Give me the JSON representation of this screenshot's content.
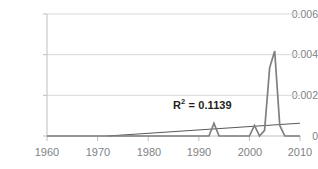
{
  "chart_data": {
    "type": "line",
    "title": "",
    "xlabel": "",
    "ylabel": "",
    "xlim": [
      1960,
      2010
    ],
    "ylim": [
      0,
      0.006
    ],
    "grid": true,
    "legend": false,
    "annotations": [
      {
        "name": "r2-label",
        "text_prefix": "R",
        "text_sup": "2",
        "text_suffix": " = 0.1139",
        "value": 0.1139
      }
    ],
    "yticks": [
      "0",
      "0.002",
      "0.004",
      "0.006"
    ],
    "ytick_values": [
      0,
      0.002,
      0.004,
      0.006
    ],
    "xticks": [
      "1960",
      "1970",
      "1980",
      "1990",
      "2000",
      "2010"
    ],
    "xtick_values": [
      1960,
      1970,
      1980,
      1990,
      2000,
      2010
    ],
    "series": [
      {
        "name": "data",
        "color": "#7f7f7f",
        "x": [
          1960,
          1961,
          1962,
          1963,
          1964,
          1965,
          1966,
          1967,
          1968,
          1969,
          1970,
          1971,
          1972,
          1973,
          1974,
          1975,
          1976,
          1977,
          1978,
          1979,
          1980,
          1981,
          1982,
          1983,
          1984,
          1985,
          1986,
          1987,
          1988,
          1989,
          1990,
          1991,
          1992,
          1993,
          1994,
          1995,
          1996,
          1997,
          1998,
          1999,
          2000,
          2001,
          2002,
          2003,
          2004,
          2005,
          2006,
          2007,
          2008,
          2009,
          2010
        ],
        "values": [
          0,
          0,
          0,
          0,
          0,
          0,
          0,
          0,
          0,
          0,
          0,
          0,
          0,
          0,
          0,
          0,
          0,
          0,
          0,
          0,
          0,
          0,
          0,
          0,
          0,
          0,
          0,
          0,
          0,
          0,
          0,
          0,
          0,
          0.00062,
          0,
          0,
          0,
          0,
          0,
          0,
          0,
          0.00052,
          0,
          0.00028,
          0.00335,
          0.00418,
          0.00052,
          0,
          0,
          0,
          0
        ]
      },
      {
        "name": "linear-trendline",
        "color": "#58595b",
        "x": [
          1972,
          2010
        ],
        "values": [
          0,
          0.00063
        ]
      }
    ]
  },
  "axis": {
    "y_tick_labels": [
      "0.006",
      "0.004",
      "0.002",
      "0"
    ],
    "x_tick_labels": [
      "1960",
      "1970",
      "1980",
      "1990",
      "2000",
      "2010"
    ]
  },
  "colors": {
    "series": "#7f7f7f",
    "trendline": "#58595b",
    "gridline": "#d9d9d9",
    "axis_text": "#808285",
    "annotation_text": "#231f20"
  }
}
